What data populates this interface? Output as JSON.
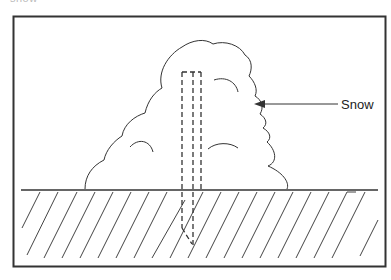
{
  "top_fragment": "snow",
  "labels": {
    "snow": "Snow"
  },
  "diagram": {
    "type": "cross-section",
    "elements": [
      "frame",
      "ground-surface",
      "ground-hatching",
      "snow-mound",
      "stake-buried-dashed",
      "arrow-pointer"
    ],
    "colors": {
      "line": "#333333",
      "background": "#ffffff"
    }
  }
}
